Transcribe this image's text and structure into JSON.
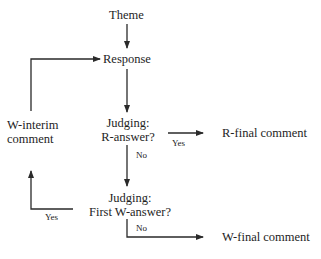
{
  "diagram": {
    "type": "flowchart",
    "colors": {
      "line": "#2a2a2a",
      "text": "#1e1e1e",
      "background": "#ffffff"
    },
    "nodes": {
      "theme": "Theme",
      "response": "Response",
      "judging_r": {
        "line1": "Judging:",
        "line2": "R-answer?"
      },
      "judging_w": {
        "line1": "Judging:",
        "line2": "First W-answer?"
      },
      "w_interim": {
        "line1": "W-interim",
        "line2": "comment"
      },
      "r_final": "R-final comment",
      "w_final": "W-final comment"
    },
    "edge_labels": {
      "r_yes": "Yes",
      "r_no": "No",
      "w_yes": "Yes",
      "w_no": "No"
    },
    "edges": [
      {
        "from": "Theme",
        "to": "Response"
      },
      {
        "from": "Response",
        "to": "Judging: R-answer?"
      },
      {
        "from": "Judging: R-answer?",
        "to": "R-final comment",
        "label": "Yes"
      },
      {
        "from": "Judging: R-answer?",
        "to": "Judging: First W-answer?",
        "label": "No"
      },
      {
        "from": "Judging: First W-answer?",
        "to": "W-interim comment",
        "label": "Yes"
      },
      {
        "from": "Judging: First W-answer?",
        "to": "W-final comment",
        "label": "No"
      },
      {
        "from": "W-interim comment",
        "to": "Response"
      }
    ]
  }
}
